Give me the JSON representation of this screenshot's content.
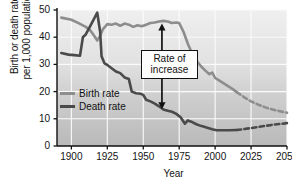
{
  "chart_data": {
    "type": "line",
    "title": "",
    "xlabel": "Year",
    "ylabel_line1": "Birth or death rate",
    "ylabel_line2": "per 1,000 population",
    "xlim": [
      1890,
      2050
    ],
    "ylim": [
      0,
      50
    ],
    "xticks": [
      1900,
      1925,
      1950,
      1975,
      2000,
      2025,
      2050
    ],
    "yticks": [
      0,
      10,
      20,
      30,
      40,
      50
    ],
    "grid": true,
    "legend_position": "inside-left",
    "series": [
      {
        "name": "Birth rate",
        "color": "#8d8d8d",
        "solid_until": 2015,
        "x": [
          1893,
          1900,
          1905,
          1910,
          1913,
          1915,
          1918,
          1920,
          1922,
          1925,
          1928,
          1931,
          1934,
          1937,
          1940,
          1943,
          1946,
          1949,
          1952,
          1955,
          1958,
          1961,
          1964,
          1967,
          1970,
          1973,
          1975,
          1978,
          1981,
          1984,
          1987,
          1990,
          1993,
          1996,
          1998,
          2000,
          2003,
          2006,
          2009,
          2012,
          2015,
          2020,
          2025,
          2030,
          2035,
          2040,
          2045,
          2050
        ],
        "y": [
          47.2,
          46.4,
          45.2,
          43.8,
          42.6,
          41.2,
          38.8,
          40.5,
          43.0,
          44.8,
          44.6,
          45.0,
          44.2,
          45.0,
          44.6,
          43.8,
          44.4,
          44.0,
          44.6,
          45.2,
          45.4,
          45.8,
          46.0,
          45.8,
          45.2,
          45.4,
          45.2,
          42.0,
          37.6,
          34.0,
          31.4,
          29.4,
          27.8,
          26.4,
          27.0,
          25.0,
          24.0,
          23.0,
          22.0,
          21.0,
          19.8,
          18.0,
          16.4,
          15.2,
          14.2,
          13.4,
          12.8,
          12.2
        ]
      },
      {
        "name": "Death rate",
        "color": "#4a4a4a",
        "solid_until": 2015,
        "x": [
          1893,
          1898,
          1902,
          1906,
          1908,
          1910,
          1913,
          1916,
          1918,
          1920,
          1921,
          1923,
          1925,
          1928,
          1931,
          1934,
          1937,
          1940,
          1942,
          1945,
          1948,
          1950,
          1952,
          1955,
          1958,
          1961,
          1964,
          1967,
          1970,
          1973,
          1976,
          1979,
          1981,
          1984,
          1987,
          1990,
          1994,
          1998,
          2001,
          2005,
          2010,
          2015,
          2020,
          2025,
          2030,
          2035,
          2040,
          2045,
          2050
        ],
        "y": [
          34.2,
          33.6,
          33.4,
          33.2,
          40.0,
          41.0,
          44.0,
          47.0,
          49.0,
          42.0,
          33.0,
          30.4,
          29.8,
          28.6,
          27.4,
          26.8,
          25.2,
          24.6,
          20.0,
          19.4,
          19.2,
          18.8,
          17.0,
          16.4,
          15.6,
          14.6,
          13.4,
          13.0,
          12.6,
          11.8,
          10.6,
          8.2,
          9.4,
          8.8,
          8.0,
          7.4,
          6.8,
          6.2,
          5.8,
          5.8,
          5.8,
          5.9,
          6.2,
          6.6,
          7.0,
          7.4,
          7.8,
          8.1,
          8.4
        ]
      }
    ],
    "annotation": {
      "line1": "Rate of",
      "line2": "increase",
      "arrow_x_year": 1963,
      "arrow_top_value": 45.0,
      "arrow_bottom_value": 13.5
    }
  },
  "legend": {
    "items": [
      {
        "label": "Birth rate",
        "color": "#8d8d8d"
      },
      {
        "label": "Death rate",
        "color": "#4a4a4a"
      }
    ]
  }
}
